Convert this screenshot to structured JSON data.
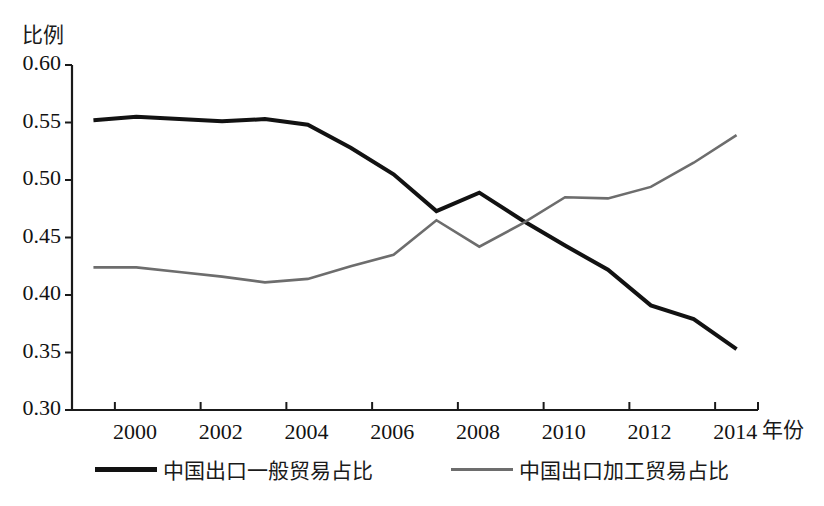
{
  "chart_data": {
    "type": "line",
    "title": "",
    "xlabel": "年份",
    "ylabel": "比例",
    "xlim": [
      1999,
      2015
    ],
    "ylim": [
      0.3,
      0.6
    ],
    "yticks": [
      "0.60",
      "0.55",
      "0.50",
      "0.45",
      "0.40",
      "0.35",
      "0.30"
    ],
    "ytick_values": [
      0.6,
      0.55,
      0.5,
      0.45,
      0.4,
      0.35,
      0.3
    ],
    "xticks": [
      "2000",
      "2002",
      "2004",
      "2006",
      "2008",
      "2010",
      "2012",
      "2014"
    ],
    "xtick_values": [
      2000,
      2002,
      2004,
      2006,
      2008,
      2010,
      2012,
      2014
    ],
    "grid": false,
    "legend_position": "bottom",
    "x": [
      1999.5,
      2000.5,
      2001.5,
      2002.5,
      2003.5,
      2004.5,
      2005.5,
      2006.5,
      2007.5,
      2008.5,
      2009.5,
      2010.5,
      2011.5,
      2012.5,
      2013.5,
      2014.5
    ],
    "series": [
      {
        "name": "中国出口一般贸易占比",
        "color": "#121212",
        "width": 4.0,
        "values": [
          0.552,
          0.555,
          0.553,
          0.551,
          0.553,
          0.548,
          0.528,
          0.505,
          0.473,
          0.489,
          0.465,
          0.443,
          0.422,
          0.391,
          0.379,
          0.353
        ]
      },
      {
        "name": "中国出口加工贸易占比",
        "color": "#6d6d6d",
        "width": 2.6,
        "values": [
          0.424,
          0.424,
          0.42,
          0.416,
          0.411,
          0.414,
          0.425,
          0.435,
          0.465,
          0.442,
          0.462,
          0.485,
          0.484,
          0.494,
          0.515,
          0.539
        ]
      }
    ]
  },
  "axes": {
    "y_axis_name": "y-axis",
    "x_axis_name": "x-axis"
  }
}
